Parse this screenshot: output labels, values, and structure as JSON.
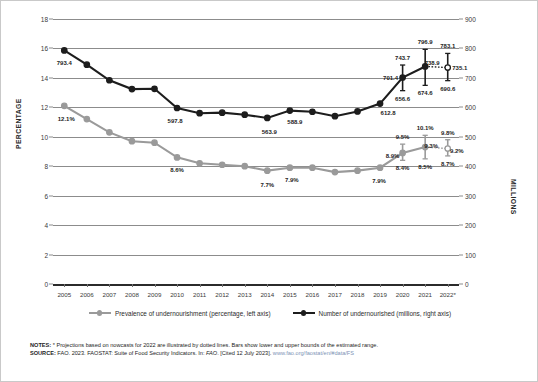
{
  "chart_data": {
    "type": "line",
    "title": "",
    "xlabel": "",
    "ylabel": "PERCENTAGE",
    "ylabel_right": "MILLIONS",
    "categories": [
      "2005",
      "2006",
      "2007",
      "2008",
      "2009",
      "2010",
      "2011",
      "2012",
      "2013",
      "2014",
      "2015",
      "2016",
      "2017",
      "2018",
      "2019",
      "2020",
      "2021",
      "2022*"
    ],
    "ylim": [
      0,
      18
    ],
    "ylim_right": [
      0,
      900
    ],
    "yticks": [
      0,
      2,
      4,
      6,
      8,
      10,
      12,
      14,
      16,
      18
    ],
    "yticks_right": [
      0,
      100,
      200,
      300,
      400,
      500,
      600,
      700,
      800,
      900
    ],
    "grid": true,
    "legend_position": "bottom",
    "series": [
      {
        "name": "Prevalence of undernourishment (percentage, left axis)",
        "axis": "left",
        "color": "#9a9a9a",
        "values": [
          12.1,
          11.2,
          10.3,
          9.7,
          9.6,
          8.6,
          8.2,
          8.1,
          8.0,
          7.7,
          7.9,
          7.9,
          7.6,
          7.7,
          7.9,
          8.9,
          9.3,
          9.2
        ],
        "labels": {
          "2005": "12.1%",
          "2010": "8.6%",
          "2014": "7.7%",
          "2015": "7.9%",
          "2019": "7.9%",
          "2020": "8.9%",
          "2021": "9.3%",
          "2022*": "9.2%"
        },
        "bounds": [
          {
            "x": "2020",
            "lower": "8.4%",
            "upper": "9.5%",
            "lower_val": 8.4,
            "upper_val": 9.5
          },
          {
            "x": "2021",
            "lower": "8.5%",
            "upper": "10.1%",
            "lower_val": 8.5,
            "upper_val": 10.1
          },
          {
            "x": "2022*",
            "lower": "8.7%",
            "upper": "9.8%",
            "lower_val": 8.7,
            "upper_val": 9.8
          }
        ],
        "dotted_from": "2021"
      },
      {
        "name": "Number of undernourished (millions, right axis)",
        "axis": "right",
        "color": "#1d1d1d",
        "values": [
          793.4,
          745.0,
          692.0,
          662.0,
          663.0,
          597.8,
          580.0,
          582.0,
          575.0,
          563.9,
          588.9,
          585.0,
          570.0,
          586.0,
          612.8,
          701.4,
          738.9,
          735.1
        ],
        "labels": {
          "2005": "793.4",
          "2010": "597.8",
          "2014": "563.9",
          "2015": "588.9",
          "2019": "612.8",
          "2020": "701.4",
          "2021": "738.9",
          "2022*": "735.1"
        },
        "bounds": [
          {
            "x": "2020",
            "lower": "656.6",
            "upper": "743.7",
            "lower_val": 656.6,
            "upper_val": 743.7
          },
          {
            "x": "2021",
            "lower": "674.6",
            "upper": "796.9",
            "lower_val": 674.6,
            "upper_val": 796.9
          },
          {
            "x": "2022*",
            "lower": "690.6",
            "upper": "783.1",
            "lower_val": 690.6,
            "upper_val": 783.1
          }
        ],
        "dotted_from": "2021"
      }
    ]
  },
  "notes": {
    "notes_label": "NOTES:",
    "notes_text": " * Projections based on nowcasts for 2022 are illustrated by dotted lines. Bars show lower and upper bounds of the estimated range.",
    "source_label": "SOURCE:",
    "source_text": " FAO. 2023. FAOSTAT: Suite of Food Security Indicators. In: ",
    "source_italic": "FAO",
    "source_cited": ". [Cited 12 July 2023]. ",
    "source_url": "www.fao.org/faostat/en/#data/FS"
  }
}
